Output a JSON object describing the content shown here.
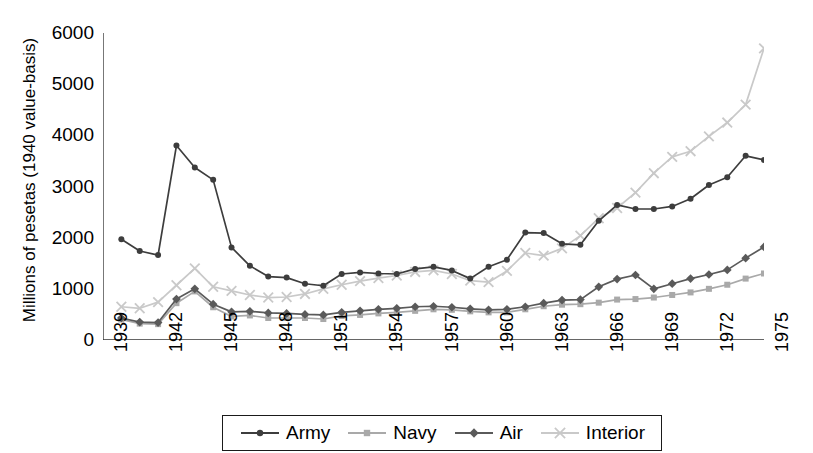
{
  "chart_data": {
    "type": "line",
    "title": "",
    "xlabel": "",
    "ylabel": "Millions of pesetas (1940 value-basis)",
    "xlim": [
      1939,
      1975
    ],
    "ylim": [
      0,
      6000
    ],
    "yticks": [
      0,
      1000,
      2000,
      3000,
      4000,
      5000,
      6000
    ],
    "ytick_labels": [
      "0",
      "1000",
      "2000",
      "3000",
      "4000",
      "5000",
      "6000"
    ],
    "xticks": [
      1939,
      1942,
      1945,
      1948,
      1951,
      1954,
      1957,
      1960,
      1963,
      1966,
      1969,
      1972,
      1975
    ],
    "xtick_labels": [
      "1939",
      "1942",
      "1945",
      "1948",
      "1951",
      "1954",
      "1957",
      "1960",
      "1963",
      "1966",
      "1969",
      "1972",
      "1975"
    ],
    "grid": false,
    "legend_position": "bottom",
    "x": [
      1940,
      1941,
      1942,
      1943,
      1944,
      1945,
      1946,
      1947,
      1948,
      1949,
      1950,
      1951,
      1952,
      1953,
      1954,
      1955,
      1956,
      1957,
      1958,
      1959,
      1960,
      1961,
      1962,
      1963,
      1964,
      1965,
      1966,
      1967,
      1968,
      1969,
      1970,
      1971,
      1972,
      1973,
      1974,
      1975
    ],
    "series": [
      {
        "name": "Army",
        "color": "#3d3d3d",
        "marker": "circle",
        "values": [
          1970,
          1740,
          1660,
          3800,
          3370,
          3130,
          1810,
          1450,
          1240,
          1220,
          1100,
          1060,
          1290,
          1320,
          1300,
          1290,
          1390,
          1430,
          1360,
          1200,
          1430,
          1570,
          2100,
          2090,
          1880,
          1860,
          2330,
          2640,
          2560,
          2560,
          2610,
          2760,
          3030,
          3180,
          3600,
          3520
        ]
      },
      {
        "name": "Navy",
        "color": "#a9a9a9",
        "marker": "square",
        "values": [
          400,
          320,
          310,
          720,
          950,
          640,
          460,
          480,
          430,
          430,
          430,
          410,
          470,
          490,
          520,
          540,
          570,
          600,
          590,
          560,
          540,
          540,
          600,
          660,
          690,
          700,
          730,
          790,
          800,
          830,
          880,
          930,
          1000,
          1080,
          1200,
          1300
        ]
      },
      {
        "name": "Air",
        "color": "#5a5a5a",
        "marker": "diamond",
        "values": [
          430,
          350,
          340,
          800,
          1000,
          700,
          550,
          560,
          530,
          520,
          500,
          490,
          540,
          570,
          600,
          620,
          650,
          660,
          640,
          610,
          590,
          600,
          650,
          720,
          780,
          790,
          1040,
          1190,
          1270,
          1000,
          1100,
          1200,
          1280,
          1370,
          1600,
          1820
        ]
      },
      {
        "name": "Interior",
        "color": "#c9c9c9",
        "marker": "x",
        "values": [
          650,
          620,
          740,
          1070,
          1400,
          1040,
          960,
          880,
          830,
          840,
          900,
          1000,
          1080,
          1150,
          1210,
          1260,
          1330,
          1360,
          1290,
          1160,
          1130,
          1350,
          1700,
          1650,
          1790,
          2040,
          2380,
          2580,
          2880,
          3260,
          3580,
          3690,
          3980,
          4250,
          4600,
          5700
        ]
      }
    ]
  },
  "legend": {
    "items": [
      {
        "label": "Army"
      },
      {
        "label": "Navy"
      },
      {
        "label": "Air"
      },
      {
        "label": "Interior"
      }
    ]
  }
}
